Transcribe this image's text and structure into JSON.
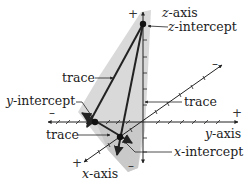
{
  "diagram": {
    "colors": {
      "plane_fill": "#d6d6d6",
      "plane_fill_dark": "#c4c4c4",
      "line": "#222222",
      "text": "#222222"
    },
    "axes": {
      "z": {
        "var": "z",
        "suffix": "-axis",
        "plus": "+",
        "minus": "–"
      },
      "y": {
        "var": "y",
        "suffix": "-axis",
        "plus": "+",
        "minus": "–"
      },
      "x": {
        "var": "x",
        "suffix": "-axis",
        "plus": "+",
        "minus": "–"
      }
    },
    "intercepts": {
      "z": {
        "var": "z",
        "suffix": "-intercept"
      },
      "y": {
        "var": "y",
        "suffix": "-intercept"
      },
      "x": {
        "var": "x",
        "suffix": "-intercept"
      }
    },
    "traces": [
      {
        "label": "trace"
      },
      {
        "label": "trace"
      },
      {
        "label": "trace"
      }
    ]
  }
}
